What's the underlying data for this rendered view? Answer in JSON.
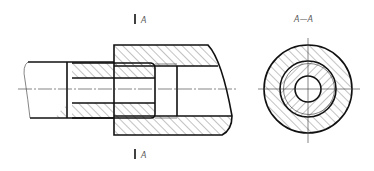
{
  "drawing": {
    "type": "engineering section drawing",
    "section_marker_top": {
      "label": "A"
    },
    "section_marker_bottom": {
      "label": "A"
    },
    "section_view_title": "A—A",
    "colors": {
      "line": "#111111",
      "hatch": "#333333",
      "label": "#555555",
      "background": "#ffffff"
    }
  },
  "views": [
    {
      "name": "longitudinal-section",
      "description": "Shaft inserted into sleeve inside housing, with cutting plane A"
    },
    {
      "name": "cross-section-A-A",
      "description": "Concentric circles: housing, sleeve, bore"
    }
  ]
}
